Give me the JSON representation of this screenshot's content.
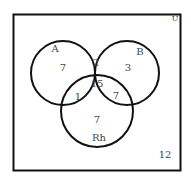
{
  "universe": {
    "label": "U",
    "outside_count": "12"
  },
  "sets": [
    {
      "name": "A",
      "label": "A"
    },
    {
      "name": "B",
      "label": "B"
    },
    {
      "name": "Rh",
      "label": "Rh"
    }
  ],
  "regions": {
    "a_only": "7",
    "b_only": "3",
    "rh_only": "7",
    "a_b_only": "2",
    "a_rh_only": "1",
    "b_rh_only": "7",
    "a_b_rh": "15"
  },
  "colors": {
    "stroke": "#111111",
    "text": "#444444",
    "background": "#ffffff"
  }
}
